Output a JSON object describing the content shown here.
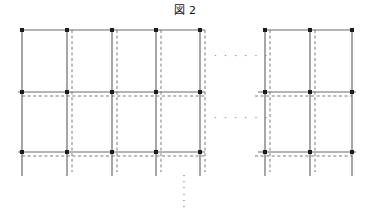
{
  "figure": {
    "title": "図 2",
    "label_number": "2",
    "kind": "lattice-grid-diagram",
    "canvas": {
      "width": 370,
      "height": 209
    }
  },
  "style": {
    "solid_line_color": "#6b6b6b",
    "dashed_line_color": "#7a7a7a",
    "node_color": "#1d1d1d",
    "background_color": "#ffffff",
    "solid_line_width": 1.2,
    "dashed_line_width": 1,
    "dash_pattern": "3,2.6",
    "node_size": 4
  },
  "geometry": {
    "solid_columns_x": [
      22,
      67,
      112,
      156,
      200,
      265,
      310,
      352
    ],
    "dashed_columns_x": [
      72,
      117,
      161,
      205,
      270,
      315
    ],
    "solid_rows_y": [
      30,
      92,
      152
    ],
    "dashed_rows_y": [
      96,
      156
    ],
    "column_top_y": 30,
    "column_bottom_y": 176,
    "dashed_column_bottom_y": 172,
    "left_group_x_start": 22,
    "left_group_x_end": 200,
    "right_group_x_start": 265,
    "right_group_x_end": 352
  },
  "nodes": [
    {
      "name": "node-r1-c1",
      "x": 22,
      "y": 30
    },
    {
      "name": "node-r1-c2",
      "x": 67,
      "y": 30
    },
    {
      "name": "node-r1-c3",
      "x": 112,
      "y": 30
    },
    {
      "name": "node-r1-c4",
      "x": 156,
      "y": 30
    },
    {
      "name": "node-r1-c5",
      "x": 200,
      "y": 30
    },
    {
      "name": "node-r1-c6",
      "x": 265,
      "y": 30
    },
    {
      "name": "node-r1-c7",
      "x": 310,
      "y": 30
    },
    {
      "name": "node-r1-c8",
      "x": 352,
      "y": 30
    },
    {
      "name": "node-r2-c1",
      "x": 22,
      "y": 92
    },
    {
      "name": "node-r2-c2",
      "x": 67,
      "y": 92
    },
    {
      "name": "node-r2-c3",
      "x": 112,
      "y": 92
    },
    {
      "name": "node-r2-c4",
      "x": 156,
      "y": 92
    },
    {
      "name": "node-r2-c5",
      "x": 200,
      "y": 92
    },
    {
      "name": "node-r2-c6",
      "x": 265,
      "y": 92
    },
    {
      "name": "node-r2-c7",
      "x": 310,
      "y": 92
    },
    {
      "name": "node-r2-c8",
      "x": 352,
      "y": 92
    },
    {
      "name": "node-r3-c1",
      "x": 22,
      "y": 152
    },
    {
      "name": "node-r3-c2",
      "x": 67,
      "y": 152
    },
    {
      "name": "node-r3-c3",
      "x": 112,
      "y": 152
    },
    {
      "name": "node-r3-c4",
      "x": 156,
      "y": 152
    },
    {
      "name": "node-r3-c5",
      "x": 200,
      "y": 152
    },
    {
      "name": "node-r3-c6",
      "x": 265,
      "y": 152
    },
    {
      "name": "node-r3-c7",
      "x": 310,
      "y": 152
    },
    {
      "name": "node-r3-c8",
      "x": 352,
      "y": 152
    }
  ],
  "continuation_marks": {
    "horizontal_row1": {
      "text": "· · · · · ·",
      "x": 214,
      "y": 52
    },
    "horizontal_row2": {
      "text": "· · · · · ·",
      "x": 214,
      "y": 114
    },
    "vertical_bottom": {
      "text": "·\n·\n·\n·\n·\n·",
      "x": 179,
      "y": 173
    }
  }
}
